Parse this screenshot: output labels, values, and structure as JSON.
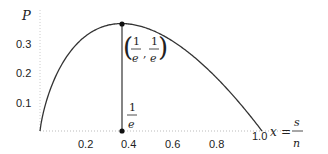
{
  "chart_data": {
    "type": "line",
    "title": "",
    "xlabel": "x = s/n",
    "ylabel": "P",
    "xlim": [
      0,
      1.0
    ],
    "ylim": [
      0,
      0.37
    ],
    "x_ticks": [
      "0.2",
      "0.4",
      "0.6",
      "0.8",
      "1.0"
    ],
    "y_ticks": [
      "0.1",
      "0.2",
      "0.3"
    ],
    "grid": false,
    "series": [
      {
        "name": "P(x) = -x ln x",
        "x": [
          0.0,
          0.05,
          0.1,
          0.15,
          0.2,
          0.25,
          0.3,
          0.368,
          0.4,
          0.5,
          0.6,
          0.7,
          0.8,
          0.9,
          1.0
        ],
        "values": [
          0.0,
          0.15,
          0.23,
          0.285,
          0.322,
          0.347,
          0.361,
          0.368,
          0.367,
          0.347,
          0.306,
          0.25,
          0.179,
          0.095,
          0.0
        ]
      }
    ],
    "annotations": [
      {
        "type": "point",
        "x": 0.368,
        "y": 0.368,
        "label": "(1/e, 1/e)"
      },
      {
        "type": "point",
        "x": 0.368,
        "y": 0.0,
        "label": "1/e"
      },
      {
        "type": "vline",
        "x": 0.368,
        "from": 0.0,
        "to": 0.368
      }
    ]
  },
  "labels": {
    "y_axis": "P",
    "x_axis_var": "x",
    "x_axis_eq": "=",
    "x_axis_num": "s",
    "x_axis_den": "n",
    "peak_open": "(",
    "peak_close": ")",
    "peak_comma": ",",
    "one": "1",
    "e": "e"
  }
}
